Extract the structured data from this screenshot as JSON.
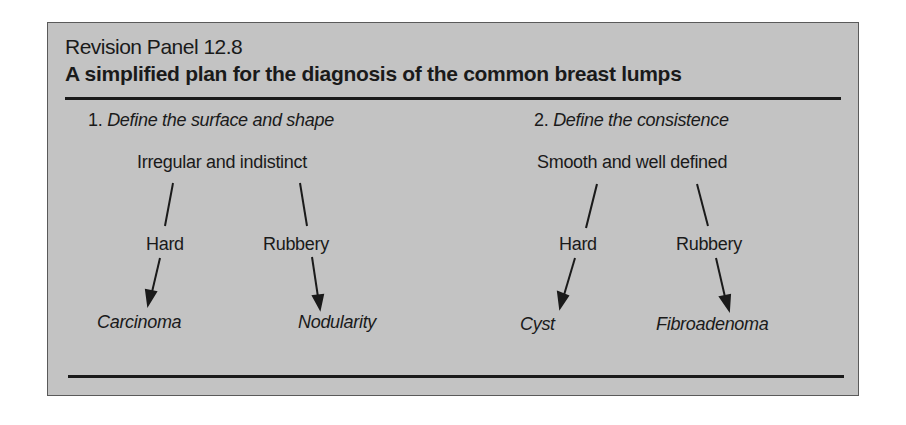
{
  "panel": {
    "number": "Revision Panel 12.8",
    "title": "A simplified plan for the diagnosis of the common breast lumps",
    "background_color": "#c3c3c3"
  },
  "steps": [
    {
      "index": "1.",
      "label": "Define the surface and shape",
      "root": "Irregular and indistinct",
      "branches": [
        {
          "label": "Hard",
          "result": "Carcinoma"
        },
        {
          "label": "Rubbery",
          "result": "Nodularity"
        }
      ]
    },
    {
      "index": "2.",
      "label": "Define the consistence",
      "root": "Smooth and well defined",
      "branches": [
        {
          "label": "Hard",
          "result": "Cyst"
        },
        {
          "label": "Rubbery",
          "result": "Fibroadenoma"
        }
      ]
    }
  ]
}
